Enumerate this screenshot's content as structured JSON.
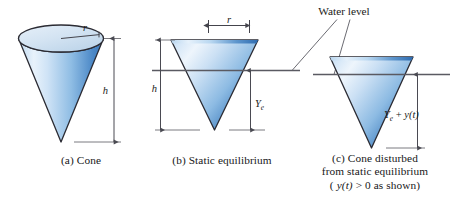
{
  "figure": {
    "water_level_label": "Water level",
    "panels": [
      {
        "id": "a",
        "caption": "(a) Cone",
        "labels": {
          "radius": "r",
          "height": "h"
        }
      },
      {
        "id": "b",
        "caption": "(b) Static equilibrium",
        "labels": {
          "radius": "r",
          "height": "h",
          "draft": "Y",
          "draft_sub": "e"
        }
      },
      {
        "id": "c",
        "caption_line1": "(c) Cone disturbed",
        "caption_line2": "from static equilibrium",
        "caption_line3_pre": "( ",
        "caption_line3_math": "y(t)",
        "caption_line3_post": " > 0 as shown)",
        "labels": {
          "draft": "Y",
          "draft_sub": "e",
          "draft_plus": " + ",
          "draft_y": "y(t)"
        }
      }
    ]
  },
  "colors": {
    "cone_light": "#eaf2fb",
    "cone_mid": "#9cc4e8",
    "cone_deep": "#2f6fb5",
    "ellipse_fill": "#cfe0f0",
    "outline": "#2b2b33",
    "dimension": "#4a4a52",
    "water": "#5a5a62",
    "text": "#171719",
    "background": "#ffffff"
  }
}
